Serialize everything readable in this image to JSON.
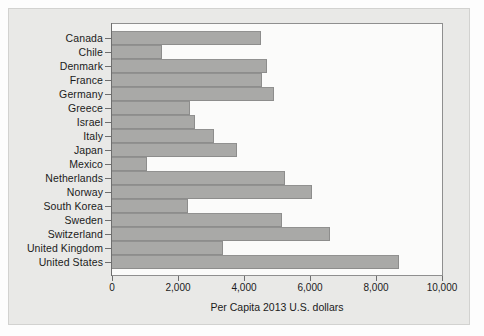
{
  "figure": {
    "panel_background": "#e9e9e7",
    "page_background": "#ffffff",
    "bar_color": "#a9a9a7",
    "bar_border_color": "#8d8d8c",
    "axis_color": "#6e6e6e",
    "text_color": "#1b1b1b"
  },
  "chart_data": {
    "type": "bar",
    "orientation": "horizontal",
    "title": "",
    "xlabel": "Per Capita 2013 U.S. dollars",
    "ylabel": "",
    "xlim": [
      0,
      10000
    ],
    "grid": false,
    "legend": false,
    "xticks": [
      0,
      2000,
      4000,
      6000,
      8000,
      10000
    ],
    "xtick_labels": [
      "0",
      "2,000",
      "4,000",
      "6,000",
      "8,000",
      "10,000"
    ],
    "categories": [
      "Canada",
      "Chile",
      "Denmark",
      "France",
      "Germany",
      "Greece",
      "Israel",
      "Italy",
      "Japan",
      "Mexico",
      "Netherlands",
      "Norway",
      "South Korea",
      "Sweden",
      "Switzerland",
      "United Kingdom",
      "United States"
    ],
    "values": [
      4500,
      1500,
      4700,
      4550,
      4900,
      2350,
      2500,
      3100,
      3800,
      1050,
      5250,
      6050,
      2300,
      5150,
      6600,
      3350,
      8700
    ]
  }
}
